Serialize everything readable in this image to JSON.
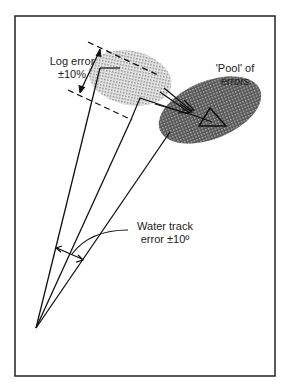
{
  "diagram": {
    "labels": {
      "log_error_line1": "Log error",
      "log_error_line2": "±10%",
      "pool_line1": "'Pool' of",
      "pool_line2": "errors",
      "water_line1": "Water track",
      "water_line2": "error ±10º"
    },
    "colors": {
      "frame": "#222222",
      "light_ellipse": "#bdbdbd",
      "dark_ellipse": "#6e6e6e",
      "ink": "#111111"
    }
  }
}
